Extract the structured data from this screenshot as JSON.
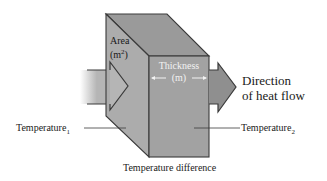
{
  "diagram": {
    "labels": {
      "area": "Area",
      "area_unit_open": "(m",
      "area_unit_exp": "2",
      "area_unit_close": ")",
      "thickness": "Thickness",
      "thickness_unit": "(m)",
      "direction_line1": "Direction",
      "direction_line2": "of heat flow",
      "temperature1_base": "Temperature",
      "temperature1_sub": "1",
      "temperature2_base": "Temperature",
      "temperature2_sub": "2",
      "temperature_difference": "Temperature difference"
    },
    "colors": {
      "top_face": "#9a9a9a",
      "left_face": "#a8a8a8",
      "front_face": "#a0a0a0",
      "arrow_in": "#b5b5b5",
      "arrow_out": "#8f8f8f",
      "edge": "#3a3a3a",
      "background": "#ffffff"
    }
  }
}
